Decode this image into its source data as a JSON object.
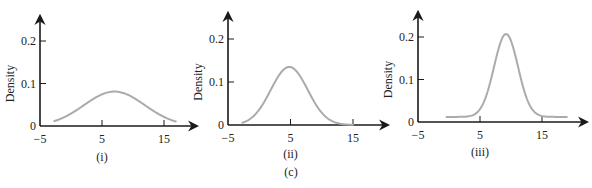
{
  "figure": {
    "caption": "(c)",
    "caption_pos": [
      291,
      176
    ]
  },
  "chart_data": [
    {
      "type": "line",
      "panel_label": "(i)",
      "ylabel": "Density",
      "xlabel": "",
      "x_ticks": [
        -5,
        5,
        15
      ],
      "x_tick_labels": [
        "−5",
        "5",
        "15"
      ],
      "y_ticks": [
        0,
        0.1,
        0.2
      ],
      "y_tick_labels": [
        "0",
        "0.1",
        "0.2"
      ],
      "xlim": [
        -5,
        20.5
      ],
      "ylim": [
        0,
        0.26
      ],
      "grid": false,
      "curve": {
        "mean": 7,
        "sd": 4.9,
        "x_start": -2.7,
        "x_end": 16.9,
        "peak_density": 0.081
      },
      "layout": {
        "origin_x": 40,
        "origin_y": 126,
        "px_per_x": 6.2,
        "px_per_y": 425,
        "x_arrow_end": 197,
        "y_arrow_top": 16,
        "panel_label_y": 161
      }
    },
    {
      "type": "line",
      "panel_label": "(ii)",
      "ylabel": "Density",
      "xlabel": "",
      "x_ticks": [
        -5,
        5,
        15
      ],
      "x_tick_labels": [
        "−5",
        "5",
        "15"
      ],
      "y_ticks": [
        0,
        0.1,
        0.2
      ],
      "y_tick_labels": [
        "0",
        "0.1",
        "0.2"
      ],
      "xlim": [
        -5,
        19
      ],
      "ylim": [
        0,
        0.26
      ],
      "grid": false,
      "curve": {
        "mean": 4.8,
        "sd": 2.95,
        "x_start": -2.7,
        "x_end": 15,
        "peak_density": 0.135
      },
      "layout": {
        "origin_x": 228,
        "origin_y": 125,
        "px_per_x": 6.25,
        "px_per_y": 430,
        "x_arrow_end": 388,
        "y_arrow_top": 13,
        "panel_label_y": 158
      }
    },
    {
      "type": "line",
      "panel_label": "(iii)",
      "ylabel": "Density",
      "xlabel": "",
      "x_ticks": [
        -5,
        5,
        15
      ],
      "x_tick_labels": [
        "−5",
        "5",
        "15"
      ],
      "y_ticks": [
        0,
        0.1,
        0.2
      ],
      "y_tick_labels": [
        "0",
        "0.1",
        "0.2"
      ],
      "xlim": [
        -5,
        21.5
      ],
      "ylim": [
        0,
        0.26
      ],
      "grid": false,
      "curve": {
        "mean": 9.2,
        "sd": 1.93,
        "x_start": -0.4,
        "x_end": 19,
        "peak_density": 0.207,
        "baseline": 0.012
      },
      "layout": {
        "origin_x": 418,
        "origin_y": 122,
        "px_per_x": 6.2,
        "px_per_y": 425,
        "x_arrow_end": 587,
        "y_arrow_top": 12,
        "panel_label_y": 156
      }
    }
  ]
}
